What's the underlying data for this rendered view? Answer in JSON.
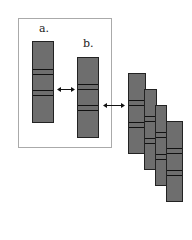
{
  "labels": {
    "a": "a.",
    "b": "b."
  },
  "colors": {
    "bar": "#6e6e6e",
    "band": "#111111",
    "frame": "#aaaaaa"
  }
}
